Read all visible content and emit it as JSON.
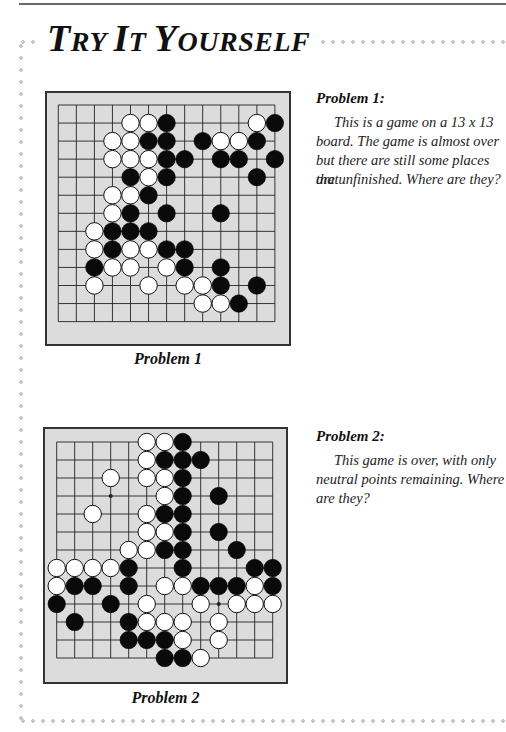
{
  "page": {
    "title_parts": [
      {
        "big": "T",
        "small": "RY "
      },
      {
        "big": "I",
        "small": "T "
      },
      {
        "big": "Y",
        "small": "OURSELF"
      }
    ],
    "title": "Try It Yourself"
  },
  "problems": [
    {
      "heading": "Problem 1:",
      "text": "This is a game on a 13 x 13 board. The game is almost over but there are still some places that are unfinished. Where are they?",
      "text_lines": [
        "This is a game on a 13 x 13",
        "board. The game is almost over",
        "but there are still some places that",
        "are unfinished. Where are they?"
      ],
      "caption": "Problem 1",
      "board": {
        "size": 13,
        "star_points": [],
        "black": [
          [
            6,
            1
          ],
          [
            12,
            1
          ],
          [
            5,
            2
          ],
          [
            6,
            2
          ],
          [
            8,
            2
          ],
          [
            11,
            2
          ],
          [
            6,
            3
          ],
          [
            7,
            3
          ],
          [
            9,
            3
          ],
          [
            10,
            3
          ],
          [
            12,
            3
          ],
          [
            4,
            4
          ],
          [
            6,
            4
          ],
          [
            11,
            4
          ],
          [
            5,
            5
          ],
          [
            4,
            6
          ],
          [
            6,
            6
          ],
          [
            9,
            6
          ],
          [
            3,
            7
          ],
          [
            4,
            7
          ],
          [
            5,
            7
          ],
          [
            3,
            8
          ],
          [
            6,
            8
          ],
          [
            7,
            8
          ],
          [
            2,
            9
          ],
          [
            7,
            9
          ],
          [
            9,
            9
          ],
          [
            9,
            10
          ],
          [
            11,
            10
          ],
          [
            10,
            11
          ]
        ],
        "white": [
          [
            4,
            1
          ],
          [
            5,
            1
          ],
          [
            11,
            1
          ],
          [
            3,
            2
          ],
          [
            4,
            2
          ],
          [
            9,
            2
          ],
          [
            10,
            2
          ],
          [
            3,
            3
          ],
          [
            4,
            3
          ],
          [
            5,
            3
          ],
          [
            5,
            4
          ],
          [
            3,
            5
          ],
          [
            4,
            5
          ],
          [
            3,
            6
          ],
          [
            2,
            7
          ],
          [
            2,
            8
          ],
          [
            4,
            8
          ],
          [
            5,
            8
          ],
          [
            3,
            9
          ],
          [
            4,
            9
          ],
          [
            6,
            9
          ],
          [
            2,
            10
          ],
          [
            5,
            10
          ],
          [
            7,
            10
          ],
          [
            8,
            10
          ],
          [
            8,
            11
          ],
          [
            9,
            11
          ]
        ]
      }
    },
    {
      "heading": "Problem 2:",
      "text": "This game is over, with only neutral points remaining. Where are they?",
      "text_lines": [
        "This game is over, with only",
        "neutral points remaining. Where",
        "are they?"
      ],
      "caption": "Problem 2",
      "board": {
        "size": 13,
        "star_points": [
          [
            3,
            3
          ],
          [
            9,
            9
          ]
        ],
        "black": [
          [
            7,
            0
          ],
          [
            6,
            1
          ],
          [
            7,
            1
          ],
          [
            8,
            1
          ],
          [
            7,
            2
          ],
          [
            7,
            3
          ],
          [
            9,
            3
          ],
          [
            6,
            4
          ],
          [
            7,
            4
          ],
          [
            7,
            5
          ],
          [
            9,
            5
          ],
          [
            6,
            6
          ],
          [
            7,
            6
          ],
          [
            10,
            6
          ],
          [
            4,
            7
          ],
          [
            7,
            7
          ],
          [
            11,
            7
          ],
          [
            12,
            7
          ],
          [
            1,
            8
          ],
          [
            2,
            8
          ],
          [
            4,
            8
          ],
          [
            8,
            8
          ],
          [
            9,
            8
          ],
          [
            10,
            8
          ],
          [
            12,
            8
          ],
          [
            0,
            9
          ],
          [
            3,
            9
          ],
          [
            1,
            10
          ],
          [
            4,
            10
          ],
          [
            4,
            11
          ],
          [
            5,
            11
          ],
          [
            6,
            11
          ],
          [
            6,
            12
          ],
          [
            7,
            12
          ]
        ],
        "white": [
          [
            5,
            0
          ],
          [
            6,
            0
          ],
          [
            5,
            1
          ],
          [
            3,
            2
          ],
          [
            5,
            2
          ],
          [
            6,
            2
          ],
          [
            6,
            3
          ],
          [
            2,
            4
          ],
          [
            5,
            4
          ],
          [
            5,
            5
          ],
          [
            6,
            5
          ],
          [
            4,
            6
          ],
          [
            5,
            6
          ],
          [
            0,
            7
          ],
          [
            1,
            7
          ],
          [
            2,
            7
          ],
          [
            3,
            7
          ],
          [
            0,
            8
          ],
          [
            6,
            8
          ],
          [
            7,
            8
          ],
          [
            11,
            8
          ],
          [
            5,
            9
          ],
          [
            8,
            9
          ],
          [
            10,
            9
          ],
          [
            11,
            9
          ],
          [
            12,
            9
          ],
          [
            5,
            10
          ],
          [
            6,
            10
          ],
          [
            7,
            10
          ],
          [
            9,
            10
          ],
          [
            7,
            11
          ],
          [
            9,
            11
          ],
          [
            8,
            12
          ]
        ]
      }
    }
  ],
  "colors": {
    "board_bg": "#dcdcdc",
    "frame": "#333333",
    "grid": "#222222",
    "black_stone": "#0a0a0a",
    "white_stone": "#ffffff",
    "dots": "#c8c8c8"
  }
}
